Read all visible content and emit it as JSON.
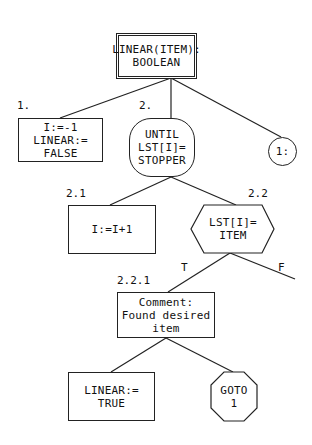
{
  "diagram": {
    "root": {
      "lines": [
        "LINEAR(ITEM):",
        "BOOLEAN"
      ]
    },
    "nodes": {
      "n1": {
        "label": "1.",
        "lines": [
          "I:=-1",
          "LINEAR:=",
          "FALSE"
        ]
      },
      "n2": {
        "label": "2.",
        "lines": [
          "UNTIL",
          "LST[I]=",
          "STOPPER"
        ]
      },
      "n3": {
        "label": "",
        "lines": [
          "1:"
        ]
      },
      "n21": {
        "label": "2.1",
        "lines": [
          "I:=I+1"
        ]
      },
      "n22": {
        "label": "2.2",
        "lines": [
          "LST[I]=",
          "ITEM"
        ]
      },
      "n221": {
        "label": "2.2.1",
        "lines": [
          "Comment:",
          "Found desired",
          "item"
        ]
      },
      "n2211": {
        "lines": [
          "LINEAR:=",
          "TRUE"
        ]
      },
      "n2212": {
        "lines": [
          "GOTO",
          "1"
        ]
      }
    },
    "branch_labels": {
      "true": "T",
      "false": "F"
    },
    "colors": {
      "stroke": "#222222",
      "background": "#ffffff"
    }
  }
}
